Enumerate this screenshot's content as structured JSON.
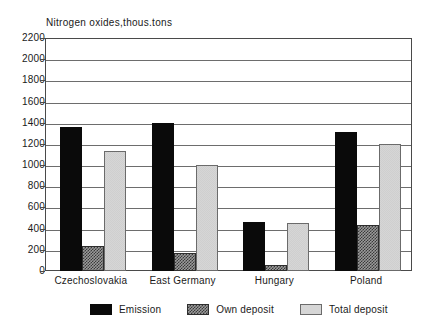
{
  "chart_data": {
    "type": "bar",
    "title": "Nitrogen oxides,thous.tons",
    "xlabel": "",
    "ylabel": "",
    "ylim": [
      0,
      2200
    ],
    "ytick_step": 200,
    "yticks": [
      2200,
      2000,
      1800,
      1600,
      1400,
      1200,
      1000,
      800,
      600,
      400,
      200,
      0
    ],
    "grid": true,
    "legend_position": "bottom",
    "categories": [
      "Czechoslovakia",
      "East Germany",
      "Hungary",
      "Poland"
    ],
    "series": [
      {
        "name": "Emission",
        "values": [
          1360,
          1400,
          460,
          1310
        ]
      },
      {
        "name": "Own deposit",
        "values": [
          240,
          170,
          60,
          430
        ]
      },
      {
        "name": "Total deposit",
        "values": [
          1130,
          1000,
          450,
          1200
        ]
      }
    ]
  },
  "legend": {
    "items": [
      {
        "label": "Emission",
        "swatch": "emission-swatch"
      },
      {
        "label": "Own deposit",
        "swatch": "own-deposit-swatch"
      },
      {
        "label": "Total deposit",
        "swatch": "total-deposit-swatch"
      }
    ]
  },
  "colors": {
    "emission": "#0a0a0a",
    "own_deposit": "#6f6f6f",
    "total_deposit": "#d6d6d6",
    "axis": "#4a4a4a",
    "grid": "#6d6d6d",
    "background": "#ffffff"
  }
}
